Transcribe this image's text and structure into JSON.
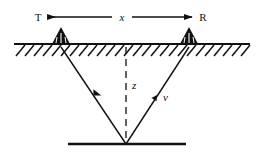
{
  "figure": {
    "type": "seismic-reflection-ray-diagram",
    "background_color": "#ffffff",
    "line_color": "#111111",
    "width": 264,
    "height": 164
  },
  "labels": {
    "transmitter": "T",
    "receiver": "R",
    "offset_distance": "x",
    "depth": "z",
    "velocity": "v"
  },
  "geometry": {
    "ground_line": {
      "x1": 14,
      "x2": 250,
      "y": 44
    },
    "reflector_line": {
      "x1": 68,
      "x2": 186,
      "y": 144
    },
    "hatching": {
      "count": 26,
      "slant": "right",
      "length": 11
    },
    "dimension_arrow": {
      "x1": 48,
      "x2": 192,
      "y": 17,
      "heads": "both"
    },
    "source_triangle": {
      "cx": 61,
      "base_y": 44,
      "half_width": 9,
      "height": 17
    },
    "receiver_triangle": {
      "cx": 189,
      "base_y": 44,
      "half_width": 9,
      "height": 17
    },
    "reflection_point": {
      "x": 126,
      "y": 144
    },
    "downgoing_ray": {
      "x1": 61,
      "y1": 47,
      "x2": 126,
      "y2": 144
    },
    "upgoing_ray": {
      "x1": 126,
      "y1": 144,
      "x2": 189,
      "y2": 47
    },
    "depth_dashed_line": {
      "x": 126,
      "y1": 47,
      "y2": 144
    }
  },
  "label_positions": {
    "transmitter": {
      "x": 38,
      "y": 21
    },
    "receiver": {
      "x": 201,
      "y": 21
    },
    "offset_distance": {
      "x": 122,
      "y": 21
    },
    "depth": {
      "x": 131,
      "y": 89
    },
    "velocity": {
      "x": 162,
      "y": 100
    }
  }
}
